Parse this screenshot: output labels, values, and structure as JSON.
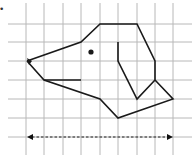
{
  "diagram": {
    "type": "grid-drawing",
    "bullet": "•",
    "colors": {
      "grid": "#b8b8b8",
      "outline": "#1a1a1a",
      "background": "#ffffff"
    },
    "grid": {
      "columns_x": [
        26,
        44,
        63,
        81,
        100,
        118,
        137,
        155,
        173
      ],
      "rows_y": [
        24,
        42,
        61,
        80,
        99,
        118,
        137
      ],
      "x_start": 8,
      "x_end": 192,
      "y_start": 3,
      "y_end": 155
    },
    "outline_points": "27,61 81,42 100,24 137,24 155,61 155,80 173,99 118,118 100,99 44,80 27,61",
    "mouth_line": {
      "x1": 44,
      "y1": 80,
      "x2": 81,
      "y2": 80
    },
    "ear_polyline": "118,42 118,61 137,99 155,80",
    "eye": {
      "cx": 91,
      "cy": 52,
      "r": 2.6
    },
    "nose_triangle": "27,58 32,61 29,65",
    "dashed_arrow": {
      "x1": 29,
      "x2": 171,
      "y": 137
    }
  }
}
